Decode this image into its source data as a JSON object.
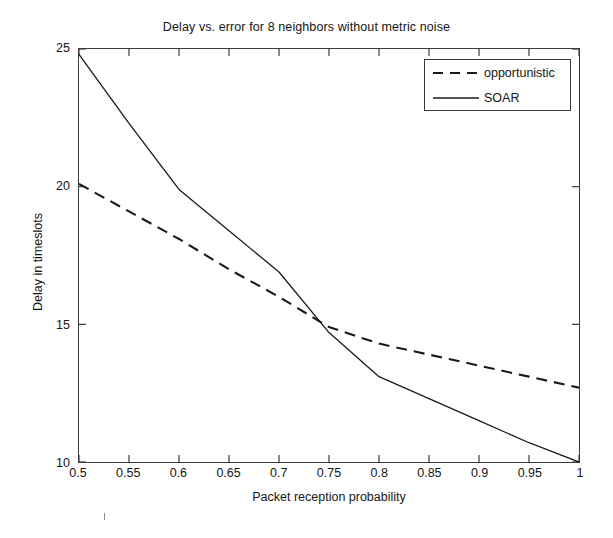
{
  "chart_data": {
    "type": "line",
    "title": "Delay vs. error for 8 neighbors without metric noise",
    "xlabel": "Packet reception probability",
    "ylabel": "Delay in timeslots",
    "xlim": [
      0.5,
      1.0
    ],
    "ylim": [
      10,
      25
    ],
    "xticks": [
      "0.5",
      "0.55",
      "0.6",
      "0.65",
      "0.7",
      "0.75",
      "0.8",
      "0.85",
      "0.9",
      "0.95",
      "1"
    ],
    "xtick_values": [
      0.5,
      0.55,
      0.6,
      0.65,
      0.7,
      0.75,
      0.8,
      0.85,
      0.9,
      0.95,
      1.0
    ],
    "yticks": [
      "10",
      "15",
      "20",
      "25"
    ],
    "ytick_values": [
      10,
      15,
      20,
      25
    ],
    "grid": false,
    "legend_position": "top-right",
    "series": [
      {
        "name": "opportunistic",
        "style": "dashed",
        "color": "#1a1a1a",
        "x": [
          0.5,
          0.55,
          0.6,
          0.65,
          0.7,
          0.75,
          0.8,
          0.85,
          0.9,
          0.95,
          1.0
        ],
        "values": [
          20.1,
          19.1,
          18.1,
          17.0,
          16.0,
          14.9,
          14.3,
          13.9,
          13.5,
          13.1,
          12.7
        ]
      },
      {
        "name": "SOAR",
        "style": "solid",
        "color": "#1a1a1a",
        "x": [
          0.5,
          0.55,
          0.6,
          0.65,
          0.7,
          0.75,
          0.8,
          0.85,
          0.9,
          0.95,
          1.0
        ],
        "values": [
          24.8,
          22.3,
          19.9,
          18.4,
          16.9,
          14.7,
          13.1,
          12.3,
          11.5,
          10.7,
          10.0
        ]
      }
    ]
  },
  "legend": {
    "items": [
      {
        "label": "opportunistic",
        "style": "dashed"
      },
      {
        "label": "SOAR",
        "style": "solid"
      }
    ]
  }
}
